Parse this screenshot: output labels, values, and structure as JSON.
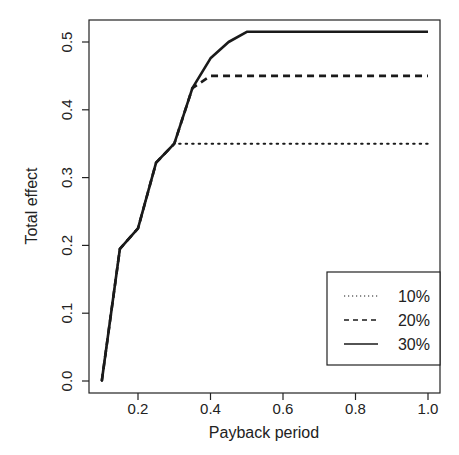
{
  "chart_data": {
    "type": "line",
    "title": "",
    "xlabel": "Payback period",
    "ylabel": "Total effect",
    "xlim": [
      0.08,
      1.03
    ],
    "ylim": [
      -0.03,
      0.535
    ],
    "xticks": [
      0.2,
      0.4,
      0.6,
      0.8,
      1.0
    ],
    "xtick_labels": [
      "0.2",
      "0.4",
      "0.6",
      "0.8",
      "1.0"
    ],
    "yticks": [
      0.0,
      0.1,
      0.2,
      0.3,
      0.4,
      0.5
    ],
    "ytick_labels": [
      "0.0",
      "0.1",
      "0.2",
      "0.3",
      "0.4",
      "0.5"
    ],
    "grid": false,
    "legend_position": "bottom-right",
    "series": [
      {
        "name": "10%",
        "style": "dotted",
        "x": [
          0.1,
          0.15,
          0.2,
          0.25,
          0.3,
          1.0
        ],
        "y": [
          0.0,
          0.195,
          0.225,
          0.322,
          0.35,
          0.35
        ]
      },
      {
        "name": "20%",
        "style": "dashed",
        "x": [
          0.1,
          0.15,
          0.2,
          0.25,
          0.3,
          0.35,
          0.4,
          1.0
        ],
        "y": [
          0.0,
          0.195,
          0.225,
          0.322,
          0.35,
          0.432,
          0.45,
          0.45
        ]
      },
      {
        "name": "30%",
        "style": "solid",
        "x": [
          0.1,
          0.15,
          0.2,
          0.25,
          0.3,
          0.35,
          0.4,
          0.45,
          0.5,
          1.0
        ],
        "y": [
          0.0,
          0.195,
          0.225,
          0.322,
          0.35,
          0.432,
          0.476,
          0.5,
          0.515,
          0.515
        ]
      }
    ]
  }
}
